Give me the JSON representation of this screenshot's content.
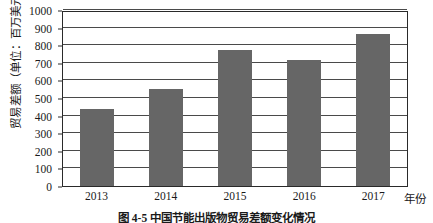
{
  "chart_data": {
    "type": "bar",
    "title": "",
    "caption": "图 4-5  中国节能出版物贸易差额变化情况",
    "xlabel": "年份",
    "ylabel": "贸易差额（单位：百万美元）",
    "categories": [
      "2013",
      "2014",
      "2015",
      "2016",
      "2017"
    ],
    "values": [
      440,
      553,
      770,
      718,
      865
    ],
    "ylim": [
      0,
      1000
    ],
    "ytick_step": 100,
    "yticks": [
      "0",
      "100",
      "200",
      "300",
      "400",
      "500",
      "600",
      "700",
      "800",
      "900",
      "1000"
    ],
    "grid": true,
    "legend": "none",
    "bar_color": "#666666",
    "frame_color": "#2a2a2a",
    "background": "#ffffff"
  }
}
